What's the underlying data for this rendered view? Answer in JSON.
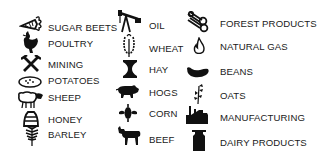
{
  "legend": {
    "columns": [
      {
        "items": [
          {
            "icon": "sugar-beet-icon",
            "label": "SUGAR BEETS"
          },
          {
            "icon": "poultry-icon",
            "label": "POULTRY"
          },
          {
            "icon": "mining-icon",
            "label": "MINING"
          },
          {
            "icon": "potatoes-icon",
            "label": "POTATOES"
          },
          {
            "icon": "sheep-icon",
            "label": "SHEEP"
          },
          {
            "icon": "honey-icon",
            "label": "HONEY"
          },
          {
            "icon": "barley-icon",
            "label": "BARLEY"
          }
        ]
      },
      {
        "items": [
          {
            "icon": "oil-pump-icon",
            "label": "OIL"
          },
          {
            "icon": "wheat-icon",
            "label": "WHEAT"
          },
          {
            "icon": "hay-icon",
            "label": "HAY"
          },
          {
            "icon": "hogs-icon",
            "label": "HOGS"
          },
          {
            "icon": "corn-icon",
            "label": "CORN"
          },
          {
            "icon": "beef-icon",
            "label": "BEEF"
          }
        ]
      },
      {
        "items": [
          {
            "icon": "forest-products-icon",
            "label": "FOREST PRODUCTS"
          },
          {
            "icon": "natural-gas-icon",
            "label": "NATURAL GAS"
          },
          {
            "icon": "beans-icon",
            "label": "BEANS"
          },
          {
            "icon": "oats-icon",
            "label": "OATS"
          },
          {
            "icon": "manufacturing-icon",
            "label": "MANUFACTURING"
          },
          {
            "icon": "dairy-products-icon",
            "label": "DAIRY PRODUCTS"
          }
        ]
      }
    ]
  },
  "colors": {
    "icon": "#111111",
    "text": "#1a1a1a",
    "background": "#ffffff"
  }
}
